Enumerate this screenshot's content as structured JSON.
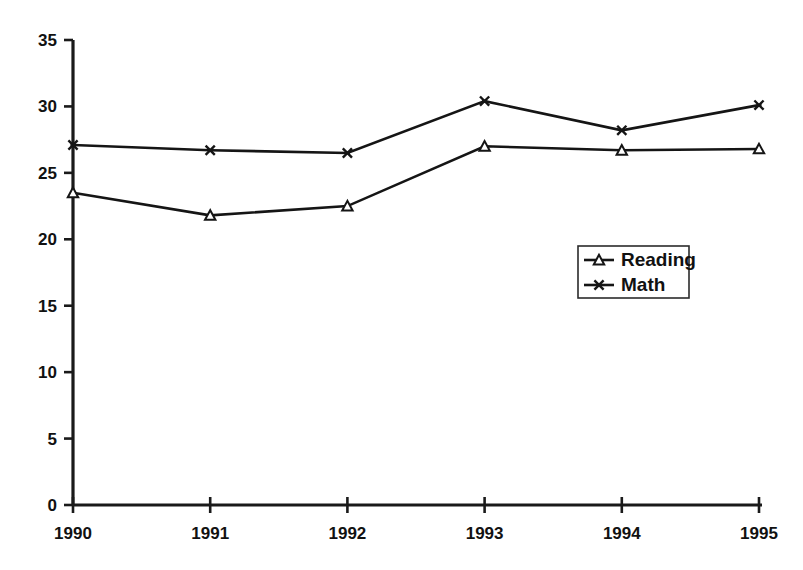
{
  "chart_data": {
    "type": "line",
    "title": "",
    "subtitle": "",
    "xlabel": "",
    "ylabel": "",
    "categories": [
      "1990",
      "1991",
      "1992",
      "1993",
      "1994",
      "1995"
    ],
    "x_tick_labels": [
      "1990",
      "1991",
      "1992",
      "1993",
      "1994",
      "1995"
    ],
    "y_tick_labels": [
      "0",
      "5",
      "10",
      "15",
      "20",
      "25",
      "30",
      "35"
    ],
    "y_ticks": [
      0,
      5,
      10,
      15,
      20,
      25,
      30,
      35
    ],
    "ylim": [
      0,
      35
    ],
    "grid": false,
    "legend_position": "center-right",
    "series": [
      {
        "name": "Reading",
        "marker": "triangle",
        "color": "#151515",
        "values": [
          23.5,
          21.8,
          22.5,
          27.0,
          26.7,
          26.8
        ]
      },
      {
        "name": "Math",
        "marker": "x-star",
        "color": "#151515",
        "values": [
          27.1,
          26.7,
          26.5,
          30.4,
          28.2,
          30.1
        ]
      }
    ],
    "legend_entries": [
      "Reading",
      "Math"
    ]
  },
  "colors": {
    "background": "#ffffff",
    "axis": "#1a1a1a",
    "series": "#151515",
    "legend_border": "#2b2b2b"
  }
}
